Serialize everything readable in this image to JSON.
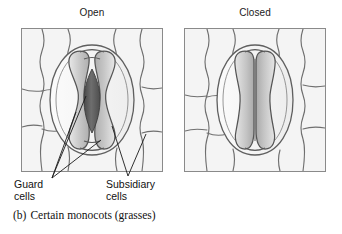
{
  "figure": {
    "caption_letter": "(b)",
    "caption_text": "Certain monocots (grasses)"
  },
  "panels": [
    {
      "id": "open",
      "title": "Open",
      "state": "open",
      "pore_visible": true,
      "pore_color": "#5d5d5d"
    },
    {
      "id": "closed",
      "title": "Closed",
      "state": "closed",
      "pore_visible": false,
      "pore_color": "#8e8e8e"
    }
  ],
  "labels": {
    "guard": {
      "line1": "Guard",
      "line2": "cells"
    },
    "subsidiary": {
      "line1": "Subsidiary",
      "line2": "cells"
    }
  },
  "colors": {
    "background": "#ffffff",
    "panel_fill": "#f2f2f2",
    "panel_border": "#8a8a8a",
    "cell_wall": "#6b6b6b",
    "guard_cell_fill": "#c9c9c9",
    "pore_dark": "#5d5d5d",
    "subsidiary_fill": "#fafafa",
    "text": "#111111"
  }
}
